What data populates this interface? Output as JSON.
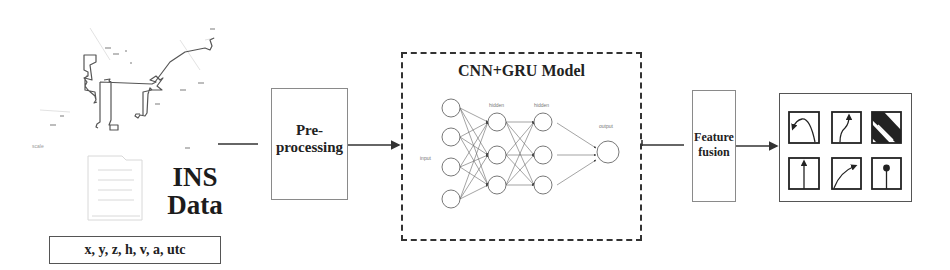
{
  "diagram": {
    "type": "pipeline-flowchart",
    "stages": [
      {
        "id": "ins-data",
        "label": "INS Data",
        "fields": "x, y, z, h, v, a, utc"
      },
      {
        "id": "preprocessing",
        "label_line1": "Pre-",
        "label_line2": "processing"
      },
      {
        "id": "model",
        "label": "CNN+GRU Model",
        "network": {
          "input_label": "input",
          "hidden1_label": "hidden",
          "hidden2_label": "hidden",
          "output_label": "output",
          "layers": [
            4,
            3,
            3,
            1
          ]
        }
      },
      {
        "id": "feature-fusion",
        "label_line1": "Feature",
        "label_line2": "fusion"
      },
      {
        "id": "results",
        "icons": [
          "left-turn-icon",
          "right-merge-icon",
          "diagonal-road-icon",
          "straight-icon",
          "right-curve-icon",
          "straight-stop-icon"
        ]
      }
    ],
    "connections": [
      [
        "ins-data",
        "preprocessing"
      ],
      [
        "preprocessing",
        "model"
      ],
      [
        "model",
        "feature-fusion"
      ],
      [
        "feature-fusion",
        "results"
      ]
    ]
  },
  "ins": {
    "title_line1": "INS",
    "title_line2": "Data",
    "fields": "x, y, z, h, v, a, utc"
  },
  "pre": {
    "line1": "Pre-",
    "line2": "processing"
  },
  "model": {
    "title": "CNN+GRU Model",
    "input": "input",
    "hidden1": "hidden",
    "hidden2": "hidden",
    "output": "output"
  },
  "fusion": {
    "line1": "Feature",
    "line2": "fusion"
  },
  "colors": {
    "line": "#333333",
    "box_border": "#8a8a8a",
    "map_trace": "#555555"
  }
}
